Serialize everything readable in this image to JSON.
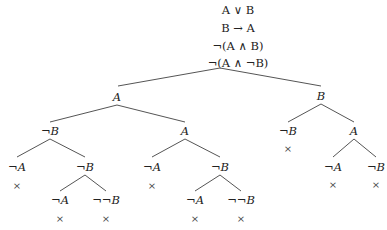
{
  "premises": [
    "A ∨ B",
    "B → A",
    "¬(A ∧ B)",
    "¬(A ∧ ¬B)"
  ],
  "tree": {
    "root_apex": [
      220,
      68
    ],
    "nodes": [
      {
        "id": "n1",
        "label": "A",
        "x": 117,
        "y": 97
      },
      {
        "id": "n2",
        "label": "B",
        "x": 321,
        "y": 96
      },
      {
        "id": "n3",
        "label": "¬B",
        "x": 50,
        "y": 131
      },
      {
        "id": "n4",
        "label": "A",
        "x": 185,
        "y": 131
      },
      {
        "id": "n5",
        "label": "¬A",
        "x": 17,
        "y": 167
      },
      {
        "id": "n6",
        "label": "¬B",
        "x": 85,
        "y": 167
      },
      {
        "id": "n7",
        "label": "¬A",
        "x": 60,
        "y": 200
      },
      {
        "id": "n8",
        "label": "¬¬B",
        "x": 106,
        "y": 200
      },
      {
        "id": "n9",
        "label": "¬A",
        "x": 152,
        "y": 167
      },
      {
        "id": "n10",
        "label": "¬B",
        "x": 220,
        "y": 167
      },
      {
        "id": "n11",
        "label": "¬A",
        "x": 195,
        "y": 200
      },
      {
        "id": "n12",
        "label": "¬¬B",
        "x": 241,
        "y": 200
      },
      {
        "id": "n13",
        "label": "¬B",
        "x": 288,
        "y": 131
      },
      {
        "id": "n14",
        "label": "A",
        "x": 354,
        "y": 131
      },
      {
        "id": "n15",
        "label": "¬A",
        "x": 333,
        "y": 167
      },
      {
        "id": "n16",
        "label": "¬B",
        "x": 376,
        "y": 167
      }
    ],
    "closed_marker": "×",
    "closures": [
      [
        17,
        185
      ],
      [
        60,
        218
      ],
      [
        106,
        218
      ],
      [
        152,
        185
      ],
      [
        195,
        218
      ],
      [
        241,
        218
      ],
      [
        288,
        148
      ],
      [
        333,
        184
      ],
      [
        376,
        184
      ]
    ],
    "edges": [
      [
        220,
        68,
        118,
        86
      ],
      [
        220,
        68,
        321,
        86
      ],
      [
        117,
        105,
        50,
        122
      ],
      [
        117,
        105,
        185,
        122
      ],
      [
        50,
        139,
        17,
        157
      ],
      [
        50,
        139,
        85,
        157
      ],
      [
        85,
        175,
        60,
        191
      ],
      [
        85,
        175,
        106,
        191
      ],
      [
        185,
        139,
        152,
        157
      ],
      [
        185,
        139,
        220,
        157
      ],
      [
        220,
        175,
        195,
        191
      ],
      [
        220,
        175,
        241,
        191
      ],
      [
        321,
        104,
        288,
        122
      ],
      [
        321,
        104,
        354,
        122
      ],
      [
        354,
        139,
        333,
        157
      ],
      [
        354,
        139,
        376,
        157
      ]
    ]
  }
}
